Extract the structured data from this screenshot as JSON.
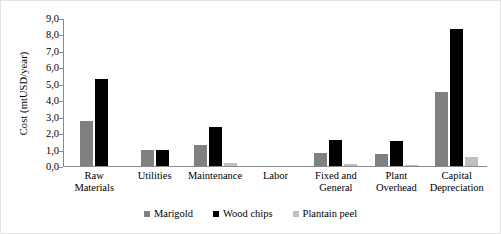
{
  "chart_data": {
    "type": "bar",
    "title": "",
    "subtitle": "",
    "xlabel": "",
    "ylabel": "Cost (mtUSD/year)",
    "ylim": [
      0,
      9
    ],
    "ytick_step": 1,
    "ytick_labels": [
      "9,0",
      "8,0",
      "7,0",
      "6,0",
      "5,0",
      "4,0",
      "3,0",
      "2,0",
      "1,0",
      "0,0"
    ],
    "decimal_separator": ",",
    "grid": false,
    "legend_position": "bottom-center",
    "orientation": "vertical",
    "grouping": "clustered",
    "categories": [
      "Raw Materials",
      "Utilities",
      "Maintenance",
      "Labor",
      "Fixed and General",
      "Plant Overhead",
      "Capital Depreciation"
    ],
    "series": [
      {
        "name": "Marigold",
        "color": "#808080",
        "values": [
          2.75,
          0.95,
          1.25,
          0,
          0.8,
          0.75,
          4.5
        ]
      },
      {
        "name": "Wood chips",
        "color": "#000000",
        "values": [
          5.3,
          0.95,
          2.4,
          0,
          1.6,
          1.5,
          8.35
        ]
      },
      {
        "name": "Plantain peel",
        "color": "#bfbfbf",
        "values": [
          0,
          0,
          0.2,
          0,
          0.1,
          0.05,
          0.55
        ]
      }
    ]
  }
}
